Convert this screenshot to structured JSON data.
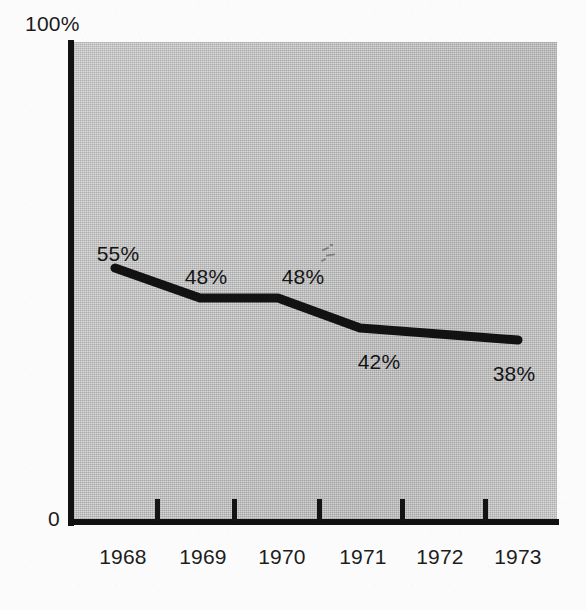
{
  "chart_data": {
    "type": "line",
    "title": "",
    "xlabel": "",
    "ylabel": "",
    "categories": [
      "1968",
      "1969",
      "1970",
      "1971",
      "1972",
      "1973"
    ],
    "values": [
      55,
      48,
      48,
      42,
      null,
      38
    ],
    "point_labels": [
      "55%",
      "48%",
      "48%",
      "42%",
      "",
      "38%"
    ],
    "ylim": [
      0,
      100
    ],
    "y_tick_labels": [
      "0",
      "100%"
    ],
    "x_tick_labels": [
      "1968",
      "1969",
      "1970",
      "1971",
      "1972",
      "1973"
    ],
    "grid": false,
    "legend": false,
    "units": "percent",
    "series": [
      {
        "name": "",
        "values": [
          55,
          48,
          48,
          42,
          null,
          38
        ]
      }
    ]
  },
  "axes": {
    "y_max_label": "100%",
    "y_min_label": "0"
  },
  "points": [
    {
      "category": "1968",
      "value_label": "55%",
      "x": 115,
      "y": 268,
      "label_x": 118,
      "label_y": 242,
      "has_label": true
    },
    {
      "category": "1969",
      "value_label": "48%",
      "x": 200,
      "y": 298,
      "label_x": 206,
      "label_y": 265,
      "has_label": true
    },
    {
      "category": "1970",
      "value_label": "48%",
      "x": 278,
      "y": 298,
      "label_x": 303,
      "label_y": 265,
      "has_label": true
    },
    {
      "category": "1971",
      "value_label": "42%",
      "x": 360,
      "y": 328,
      "label_x": 379,
      "label_y": 350,
      "has_label": true
    },
    {
      "category": "1972",
      "value_label": "",
      "x": 439,
      "y": 334,
      "label_x": 439,
      "label_y": 350,
      "has_label": false
    },
    {
      "category": "1973",
      "value_label": "38%",
      "x": 518,
      "y": 340,
      "label_x": 514,
      "label_y": 362,
      "has_label": true
    }
  ],
  "x_ticks": [
    {
      "label": "1968",
      "tick_x": null,
      "label_x": 123
    },
    {
      "label": "1969",
      "tick_x": 155,
      "label_x": 203
    },
    {
      "label": "1970",
      "tick_x": 232,
      "label_x": 282
    },
    {
      "label": "1971",
      "tick_x": 317,
      "label_x": 363
    },
    {
      "label": "1972",
      "tick_x": 400,
      "label_x": 440
    },
    {
      "label": "1973",
      "tick_x": 483,
      "label_x": 518
    }
  ],
  "colors": {
    "plot_background": "#b9b9b9",
    "page_background": "#fbfbfb",
    "axis": "#111111",
    "line": "#121212",
    "text": "#1b1b1b"
  }
}
